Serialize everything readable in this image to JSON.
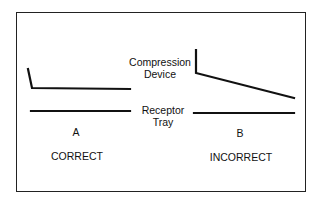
{
  "labels": {
    "compression_device": [
      "Compression",
      "Device"
    ],
    "receptor_tray": [
      "Receptor",
      "Tray"
    ],
    "panel_a": "A",
    "panel_b": "B",
    "correct": "CORRECT",
    "incorrect": "INCORRECT"
  },
  "colors": {
    "line": "#111111",
    "border": "#222222",
    "background": "#ffffff"
  }
}
